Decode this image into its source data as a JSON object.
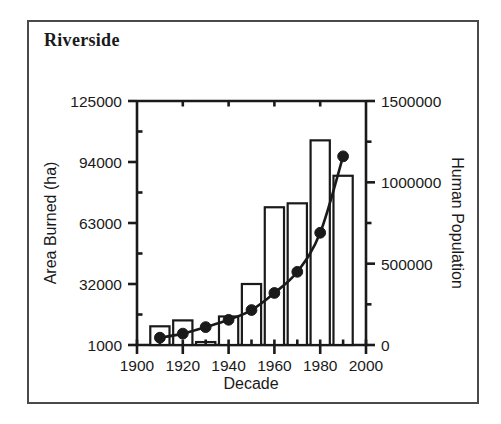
{
  "figure": {
    "title": "Riverside",
    "border_color": "#4a4a4a",
    "ink_color": "#1a1a1a",
    "background": "#ffffff"
  },
  "chart_data": {
    "type": "bar",
    "title": "Riverside",
    "xlabel": "Decade",
    "ylabel": "Area Burned (ha)",
    "y2label": "Human Population",
    "xlim": [
      1900,
      2000
    ],
    "ylim": [
      1000,
      125000
    ],
    "y2lim": [
      0,
      1500000
    ],
    "grid": false,
    "legend": "none",
    "x_ticks": [
      1900,
      1920,
      1940,
      1960,
      1980,
      2000
    ],
    "x_tick_labels": [
      "1900",
      "1920",
      "1940",
      "1960",
      "1980",
      "2000"
    ],
    "x_minor_ticks": [
      1910,
      1930,
      1950,
      1970,
      1990
    ],
    "y_ticks": [
      1000,
      32000,
      63000,
      94000,
      125000
    ],
    "y_tick_labels": [
      "1000",
      "32000",
      "63000",
      "94000",
      "125000"
    ],
    "y_minor_ticks": [
      16500,
      47500,
      78500,
      109500
    ],
    "y2_ticks": [
      0,
      500000,
      1000000,
      1500000
    ],
    "y2_tick_labels": [
      "0",
      "500000",
      "1000000",
      "1500000"
    ],
    "y2_minor_ticks": [
      250000,
      750000,
      1250000
    ],
    "categories": [
      1910,
      1920,
      1930,
      1940,
      1950,
      1960,
      1970,
      1980,
      1990
    ],
    "category_labels": [
      "1910",
      "1920",
      "1930",
      "1940",
      "1950",
      "1960",
      "1970",
      "1980",
      "1990"
    ],
    "series": [
      {
        "name": "Area Burned (ha)",
        "type": "bar",
        "axis": "left",
        "fill": "#ffffff",
        "edge": "#1a1a1a",
        "values": [
          10500,
          13500,
          2500,
          15500,
          32000,
          71000,
          73000,
          105000,
          87000
        ]
      },
      {
        "name": "Human Population",
        "type": "scatter-line",
        "axis": "right",
        "marker": "filled-circle",
        "color": "#1a1a1a",
        "values": [
          45000,
          70000,
          110000,
          155000,
          215000,
          320000,
          450000,
          690000,
          1160000
        ]
      }
    ]
  }
}
